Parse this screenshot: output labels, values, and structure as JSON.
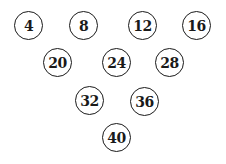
{
  "diagram": {
    "type": "numbered-circles-triangle",
    "rows": [
      {
        "balls": [
          {
            "label": "4"
          },
          {
            "label": "8"
          },
          {
            "label": "12"
          },
          {
            "label": "16"
          }
        ]
      },
      {
        "balls": [
          {
            "label": "20"
          },
          {
            "label": "24"
          },
          {
            "label": "28"
          }
        ]
      },
      {
        "balls": [
          {
            "label": "32"
          },
          {
            "label": "36"
          }
        ]
      },
      {
        "balls": [
          {
            "label": "40"
          }
        ]
      }
    ],
    "colors": {
      "stroke": "#1a1a1a",
      "text": "#1a1a1a",
      "background": "#ffffff"
    }
  }
}
